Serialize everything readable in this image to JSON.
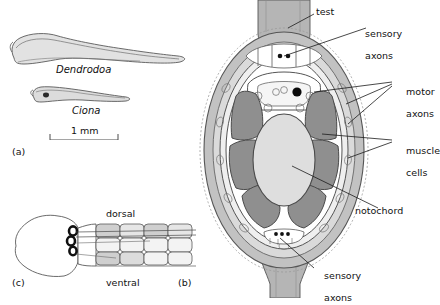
{
  "figure": {
    "background": "#ffffff",
    "ink": "#1a1a1a"
  },
  "palette": {
    "outline": "#4a4a4a",
    "test_fill": "#b9b9b9",
    "test_inner": "#d8d8d8",
    "epidermis": "#cfcfcf",
    "muscle_fill": "#8c8c8c",
    "notochord_fill": "#d9d9d9",
    "neural_fill": "#ffffff",
    "pigment_spot": "#000000",
    "larva_fill": "#e2e2e2",
    "muscle_band_light": "#eeeeee",
    "muscle_band_mid": "#cccccc"
  },
  "panels": [
    {
      "id": "a",
      "label": "(a)",
      "caption": "Whole tadpole larvae with scale bar"
    },
    {
      "id": "b",
      "label": "(b)",
      "caption": "Transverse section through the tail"
    },
    {
      "id": "c",
      "label": "(c)",
      "caption": "Head and muscle bands, dorsal and ventral"
    }
  ],
  "panel_a": {
    "species": [
      {
        "name": "Dendrodoa",
        "italic": true
      },
      {
        "name": "Ciona",
        "italic": true
      }
    ],
    "scale_bar": {
      "text": "1 mm",
      "length_mm": 1
    }
  },
  "panel_b": {
    "labels": [
      {
        "key": "test",
        "text": "test"
      },
      {
        "key": "sensory-axons-top",
        "text": "sensory\naxons",
        "line1": "sensory",
        "line2": "axons"
      },
      {
        "key": "motor-axons",
        "text": "motor\naxons",
        "line1": "motor",
        "line2": "axons"
      },
      {
        "key": "muscle-cells",
        "text": "muscle\ncells",
        "line1": "muscle",
        "line2": "cells"
      },
      {
        "key": "notochord",
        "text": "notochord"
      },
      {
        "key": "sensory-axons-bottom",
        "text": "sensory\naxons",
        "line1": "sensory",
        "line2": "axons"
      }
    ],
    "structures": {
      "muscle_cell_count": 6,
      "notochord_count": 1,
      "neural_tube": "dorsal, contains pigment spot"
    }
  },
  "panel_c": {
    "labels": [
      {
        "key": "dorsal",
        "text": "dorsal"
      },
      {
        "key": "ventral",
        "text": "ventral"
      }
    ],
    "muscle_rows": 2,
    "muscle_columns": 4,
    "pigment_organs": 3
  }
}
